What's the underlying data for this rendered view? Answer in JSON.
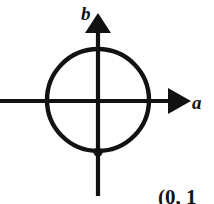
{
  "figure": {
    "background_color": "#ffffff",
    "stroke_color": "#121212",
    "width": 214,
    "height": 204
  },
  "axes": {
    "horizontal": {
      "label": "a",
      "label_x": 192,
      "label_y": 109,
      "font_size": 19,
      "y": 101,
      "x_start": 0,
      "x_end": 176,
      "arrow_tip_x": 191,
      "stroke_width": 4.2
    },
    "vertical": {
      "label": "b",
      "label_x": 81,
      "label_y": 20,
      "font_size": 19,
      "x": 98,
      "y_start": 196,
      "y_end": 28,
      "arrow_tip_y": 13,
      "stroke_width": 4.2
    }
  },
  "circle": {
    "center_x": 98,
    "center_y": 100,
    "radius": 51,
    "stroke_width": 4.4,
    "fill": "none"
  },
  "point": {
    "label": "(0,  1",
    "marker_x": 98,
    "marker_y": 152,
    "marker_radius": 4.6,
    "label_x": 158,
    "label_y": 204,
    "font_size": 21
  },
  "colors": {
    "ink": "#121212",
    "paper": "#ffffff"
  }
}
